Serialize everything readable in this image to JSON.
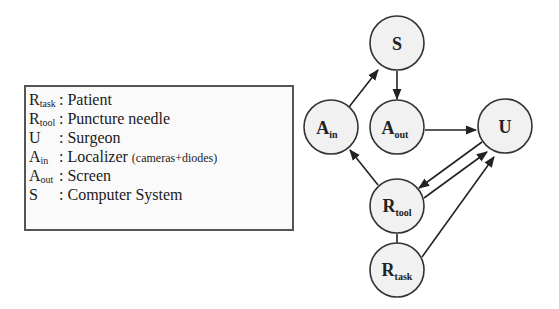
{
  "legend": {
    "rows": [
      {
        "symbol": "R",
        "sub": "task",
        "sep": ":",
        "label": "Patient",
        "note": ""
      },
      {
        "symbol": "R",
        "sub": "tool",
        "sep": ":",
        "label": "Puncture needle",
        "note": ""
      },
      {
        "symbol": "U",
        "sub": "",
        "sep": ":",
        "label": "Surgeon",
        "note": ""
      },
      {
        "symbol": "A",
        "sub": "in",
        "sep": ":",
        "label": "Localizer",
        "note": "(cameras+diodes)"
      },
      {
        "symbol": "A",
        "sub": "out",
        "sep": ":",
        "label": "Screen",
        "note": ""
      },
      {
        "symbol": "S",
        "sub": "",
        "sep": ":",
        "label": "Computer System",
        "note": ""
      }
    ]
  },
  "graph": {
    "nodes": [
      {
        "id": "S",
        "symbol": "S",
        "sub": ""
      },
      {
        "id": "A_in",
        "symbol": "A",
        "sub": "in"
      },
      {
        "id": "A_out",
        "symbol": "A",
        "sub": "out"
      },
      {
        "id": "U",
        "symbol": "U",
        "sub": ""
      },
      {
        "id": "R_tool",
        "symbol": "R",
        "sub": "tool"
      },
      {
        "id": "R_task",
        "symbol": "R",
        "sub": "task"
      }
    ],
    "edges": [
      {
        "from": "A_in",
        "to": "S",
        "directed": true
      },
      {
        "from": "S",
        "to": "A_out",
        "directed": true
      },
      {
        "from": "A_out",
        "to": "U",
        "directed": true
      },
      {
        "from": "R_tool",
        "to": "A_in",
        "directed": true
      },
      {
        "from": "U",
        "to": "R_tool",
        "directed": true
      },
      {
        "from": "R_tool",
        "to": "U",
        "directed": true
      },
      {
        "from": "R_task",
        "to": "U",
        "directed": true
      },
      {
        "from": "R_tool",
        "to": "R_task",
        "directed": false
      }
    ]
  }
}
